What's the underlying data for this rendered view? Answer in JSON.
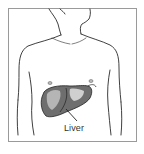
{
  "figure": {
    "label": "Liver",
    "colors": {
      "frame": "#9a9a9a",
      "line": "#2a2a2a",
      "liver_fill": "#6e6e6e",
      "liver_highlight": "#cfcfcf",
      "background": "#ffffff"
    }
  }
}
